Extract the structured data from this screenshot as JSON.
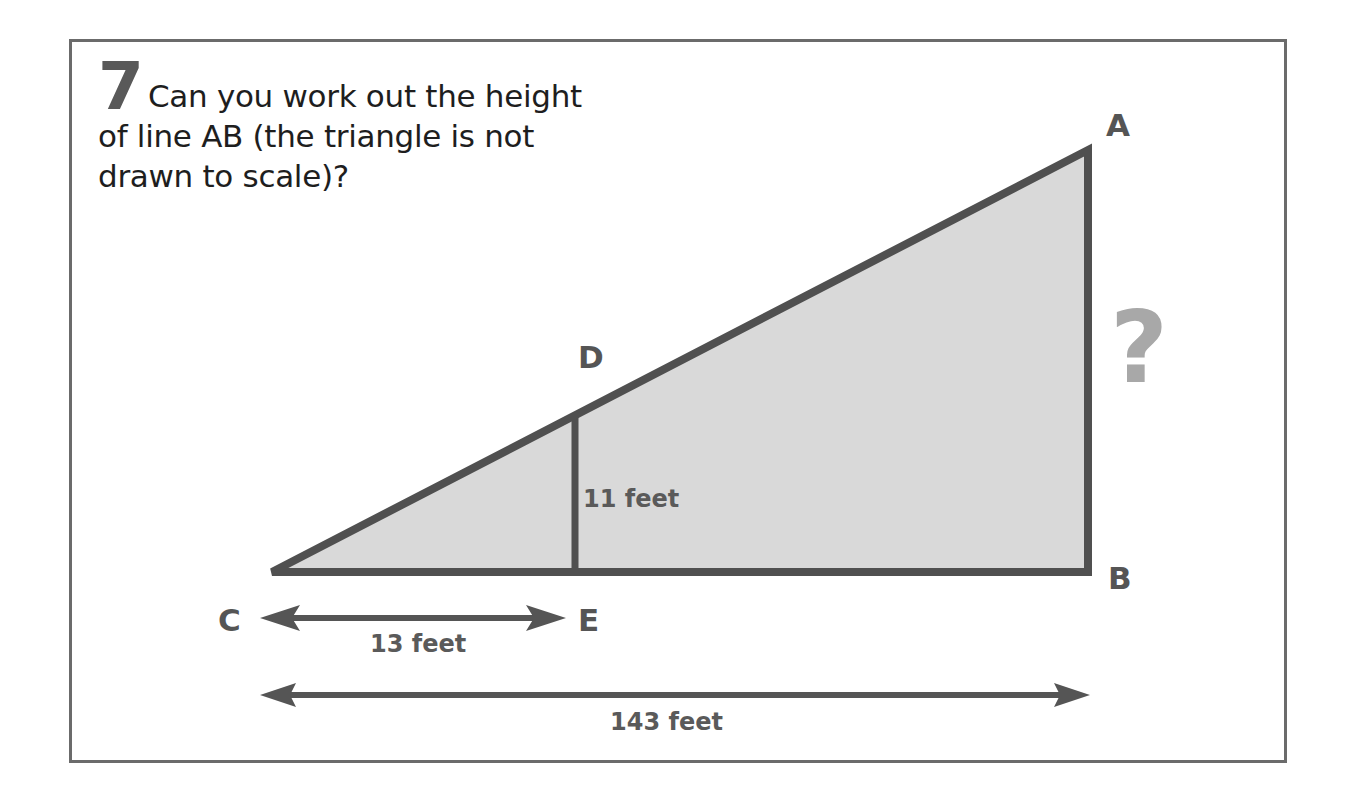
{
  "question": {
    "number": "7",
    "text": "Can you work out the height of line AB (the triangle is not drawn to scale)?"
  },
  "diagram": {
    "vertices": {
      "A": "A",
      "B": "B",
      "C": "C",
      "D": "D",
      "E": "E"
    },
    "unknown_marker": "?",
    "measurements": {
      "DE": "11 feet",
      "CE": "13 feet",
      "CB": "143 feet"
    },
    "colors": {
      "stroke": "#505050",
      "fill": "#d9d9d9",
      "frame": "#6b6b6b",
      "question_mark": "#a8a8a8",
      "number": "#595959"
    }
  }
}
